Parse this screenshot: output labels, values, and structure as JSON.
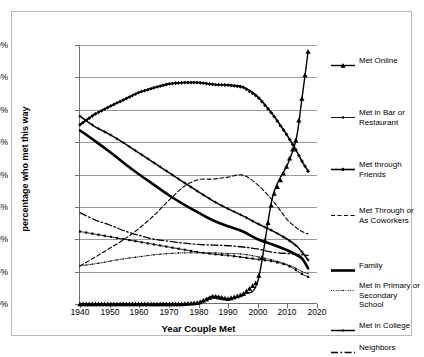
{
  "chart_data": {
    "type": "line",
    "title": "",
    "xlabel": "Year Couple Met",
    "ylabel": "percentage who met this way",
    "xlim": [
      1940,
      2020
    ],
    "ylim": [
      0,
      0.4
    ],
    "xticks": [
      "1940",
      "1950",
      "1960",
      "1970",
      "1980",
      "1990",
      "2000",
      "2010",
      "2020"
    ],
    "yticks": [
      "0%",
      "5%",
      "10%",
      "15%",
      "20%",
      "25%",
      "30%",
      "35%",
      "40%"
    ],
    "grid": "horizontal",
    "legend_position": "right",
    "x": [
      1940,
      1945,
      1950,
      1955,
      1960,
      1965,
      1970,
      1975,
      1980,
      1985,
      1990,
      1995,
      2000,
      2005,
      2010,
      2013,
      2015,
      2017
    ],
    "series": [
      {
        "name": "Met Online",
        "key": "triangle-line",
        "values": [
          0,
          0,
          0,
          0,
          0,
          0,
          0,
          0,
          0.002,
          0.012,
          0.008,
          0.015,
          0.035,
          0.165,
          0.215,
          0.255,
          0.32,
          0.39
        ]
      },
      {
        "name": "Met in Bar or Restaurant",
        "key": "square-line",
        "values": [
          0.112,
          0.108,
          0.104,
          0.1,
          0.096,
          0.092,
          0.088,
          0.084,
          0.08,
          0.077,
          0.075,
          0.072,
          0.069,
          0.066,
          0.06,
          0.052,
          0.046,
          0.042
        ]
      },
      {
        "name": "Met through Friends",
        "key": "diamond-line",
        "values": [
          0.277,
          0.293,
          0.305,
          0.316,
          0.327,
          0.334,
          0.34,
          0.342,
          0.342,
          0.339,
          0.338,
          0.335,
          0.32,
          0.293,
          0.26,
          0.237,
          0.22,
          0.205
        ]
      },
      {
        "name": "Met Through or As Coworkers",
        "key": "dashed",
        "values": [
          0.059,
          0.072,
          0.086,
          0.1,
          0.117,
          0.137,
          0.16,
          0.181,
          0.192,
          0.193,
          0.196,
          0.199,
          0.184,
          0.16,
          0.13,
          0.118,
          0.112,
          0.108
        ]
      },
      {
        "name": "Family",
        "key": "thick-solid",
        "values": [
          0.268,
          0.252,
          0.235,
          0.217,
          0.2,
          0.184,
          0.168,
          0.154,
          0.141,
          0.129,
          0.12,
          0.112,
          0.1,
          0.092,
          0.083,
          0.076,
          0.07,
          0.055
        ]
      },
      {
        "name": "Met in Primary or Secondary School",
        "key": "dot-line",
        "values": [
          0.059,
          0.062,
          0.066,
          0.07,
          0.073,
          0.076,
          0.078,
          0.079,
          0.079,
          0.079,
          0.078,
          0.077,
          0.073,
          0.068,
          0.061,
          0.055,
          0.05,
          0.047
        ]
      },
      {
        "name": "Met in College",
        "key": "plus-line",
        "values": [
          0.29,
          0.274,
          0.262,
          0.248,
          0.233,
          0.218,
          0.203,
          0.188,
          0.173,
          0.159,
          0.147,
          0.136,
          0.124,
          0.113,
          0.1,
          0.09,
          0.08,
          0.068
        ]
      },
      {
        "name": "Neighbors",
        "key": "dash-dot",
        "values": [
          0.141,
          0.13,
          0.122,
          0.113,
          0.106,
          0.1,
          0.097,
          0.094,
          0.092,
          0.091,
          0.09,
          0.088,
          0.085,
          0.08,
          0.078,
          0.077,
          0.076,
          0.075
        ]
      }
    ]
  },
  "axis": {
    "x_title": "Year Couple Met",
    "y_title": "percentage who met this way",
    "y_ticks": [
      "40%",
      "35%",
      "30%",
      "25%",
      "20%",
      "15%",
      "10%",
      "5%",
      "0%"
    ],
    "x_ticks": [
      "1940",
      "1950",
      "1960",
      "1970",
      "1980",
      "1990",
      "2000",
      "2010",
      "2020"
    ]
  },
  "legend": {
    "items": [
      {
        "label": "Met Online",
        "key": "triangle-line"
      },
      {
        "label": "Met in Bar or Restaurant",
        "key": "square-line"
      },
      {
        "label": "Met through Friends",
        "key": "diamond-line"
      },
      {
        "label": "Met Through or As Coworkers",
        "key": "dashed"
      },
      {
        "label": "Family",
        "key": "thick-solid"
      },
      {
        "label": "Met in Primary or Secondary School",
        "key": "dot-line"
      },
      {
        "label": "Met in College",
        "key": "plus-line"
      },
      {
        "label": "Neighbors",
        "key": "dash-dot"
      }
    ]
  },
  "colors": {
    "line": "#000000",
    "grid": "#9a9a9a",
    "axis": "#6e6e6e",
    "frame": "#b8b8b8",
    "background": "#ffffff"
  }
}
